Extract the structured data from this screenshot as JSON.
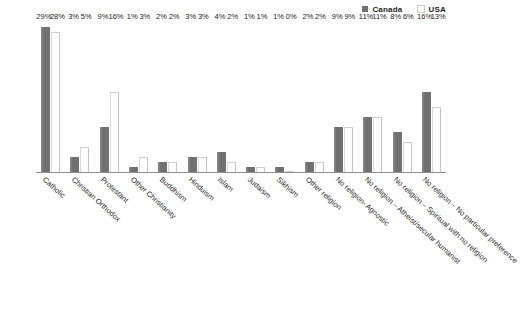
{
  "legend": {
    "position": "top-right",
    "entries": [
      {
        "label": "Canada",
        "color": "#767676",
        "icon": "legend-swatch-canada"
      },
      {
        "label": "USA",
        "color": "#fdfdfd",
        "icon": "legend-swatch-usa"
      }
    ]
  },
  "footer": {
    "note": ""
  },
  "chart_data": {
    "type": "bar",
    "title": "",
    "subtitle": "",
    "xlabel": "",
    "ylabel": "",
    "ylim": [
      0,
      30
    ],
    "grid": false,
    "legend_position": "top-right",
    "value_suffix": "%",
    "categories": [
      "Catholic",
      "Christian Orthodox",
      "Protestant",
      "Other Christianity",
      "Buddhism",
      "Hinduism",
      "Islam",
      "Judaism",
      "Sikhism",
      "Other religion",
      "No religion- Agnostic",
      "No religion – Atheist/secular  humanist",
      "No religion – Spiritual with no religion",
      "No religion – No particular preference"
    ],
    "series": [
      {
        "name": "Canada",
        "color": "#767676",
        "values": [
          29,
          3,
          9,
          1,
          2,
          3,
          4,
          1,
          1,
          2,
          9,
          11,
          8,
          16
        ],
        "labels": [
          "29%",
          "3%",
          "9%",
          "1%",
          "2%",
          "3%",
          "4%",
          "1%",
          "1%",
          "2%",
          "9%",
          "11%",
          "8%",
          "16%"
        ]
      },
      {
        "name": "USA",
        "color": "#fdfdfd",
        "values": [
          28,
          5,
          16,
          3,
          2,
          3,
          2,
          1,
          0,
          2,
          9,
          11,
          6,
          13
        ],
        "labels": [
          "28%",
          "5%",
          "16%",
          "3%",
          "2%",
          "3%",
          "2%",
          "1%",
          "0%",
          "2%",
          "9%",
          "11%",
          "6%",
          "13%"
        ]
      }
    ]
  }
}
